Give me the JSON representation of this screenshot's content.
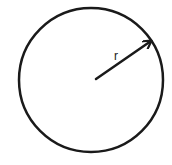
{
  "diagram": {
    "type": "circle-with-radius",
    "circle": {
      "cx": 91,
      "cy": 80,
      "r": 72,
      "stroke": "#1a1a1a",
      "stroke_width": 2.5
    },
    "radius_arrow": {
      "x1": 96,
      "y1": 79,
      "x2": 151,
      "y2": 41,
      "color": "#1a1a1a"
    },
    "radius_label": {
      "text": "r",
      "x": 114,
      "y": 60
    }
  }
}
